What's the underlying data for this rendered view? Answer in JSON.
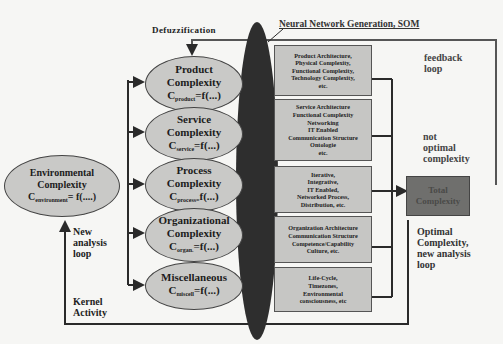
{
  "diagram": {
    "labels": {
      "defuzzification": "Defuzzification",
      "som": "Neural Network Generation, SOM",
      "feedback_loop": [
        "feedback",
        "loop"
      ],
      "not_optimal": [
        "not",
        "optimal",
        "complexity"
      ],
      "optimal": [
        "Optimal",
        "Complexity,",
        "new analysis",
        "loop"
      ],
      "new_analysis": [
        "New",
        "analysis",
        "loop"
      ],
      "kernel": [
        "Kernel",
        "Activity"
      ]
    },
    "environment": {
      "title1": "Environmental",
      "title2": "Complexity",
      "formula_c": "C",
      "formula_sub": "environment",
      "formula_rest": "= f(....)"
    },
    "ellipses": [
      {
        "l1": "Product",
        "l2": "Complexity",
        "c": "C",
        "sub": "product",
        "rest": "=f(...)"
      },
      {
        "l1": "Service",
        "l2": "Complexity",
        "c": "C",
        "sub": "service",
        "rest": "=f(...)"
      },
      {
        "l1": "Process",
        "l2": "Complexity",
        "c": "C",
        "sub": "process=",
        "rest": "f(...)"
      },
      {
        "l1": "Organizational",
        "l2": "Complexity",
        "c": "C",
        "sub": "organ.",
        "rest": "=f(...)"
      },
      {
        "l1": "Miscellaneous",
        "l2": "",
        "c": "C",
        "sub": "miscell",
        "rest": "=f(...)"
      }
    ],
    "boxes": [
      [
        "Product Architecture,",
        "Physical Complexity,",
        "Functional Complexity,",
        "Technology Complexity,",
        "etc."
      ],
      [
        "Service Architecture",
        "Functional Complexity",
        "Networking",
        "IT Enabled",
        "Communication Structure",
        "Ontologie",
        "etc."
      ],
      [
        "Iterative,",
        "Integrative,",
        "IT Enabled,",
        "Networked Process,",
        "Distribution, etc."
      ],
      [
        "Organization Architecture",
        "Communication Structure",
        "Competence/Capability",
        "Culture, etc."
      ],
      [
        "Life-Cycle,",
        "Timezones,",
        "Environmental",
        "consciousness, etc"
      ]
    ],
    "total": [
      "Total",
      "Complexity"
    ],
    "colors": {
      "ellipse_fill": "#c9c9c7",
      "box_fill": "#c6c6c4",
      "som_blob": "#2e2e2e",
      "total_fill": "#6f6f6d",
      "line": "#2a2a2a"
    }
  }
}
